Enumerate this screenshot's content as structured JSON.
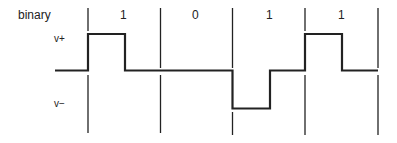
{
  "diagram": {
    "row_label": "binary",
    "bits": [
      "1",
      "0",
      "1",
      "1"
    ],
    "level_high_label": "v+",
    "level_low_label": "v−",
    "colors": {
      "line": "#222222",
      "background": "#ffffff"
    }
  }
}
